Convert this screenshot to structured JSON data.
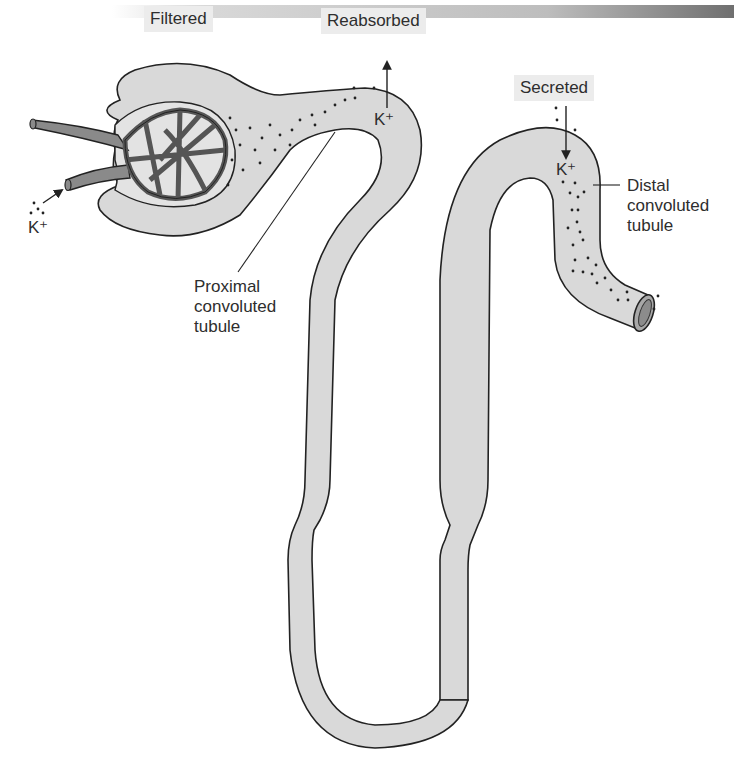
{
  "diagram": {
    "colors": {
      "tubule_fill": "#d9d9d9",
      "outline": "#222222",
      "vessel_fill": "#8a8a8a",
      "label_box": "#ececec",
      "header_bar_start": "#f2f2f2",
      "header_bar_end": "#7a7a7a"
    },
    "process_labels": {
      "filtered": "Filtered",
      "reabsorbed": "Reabsorbed",
      "secreted": "Secreted"
    },
    "ion_labels": {
      "k_afferent": "K⁺",
      "k_reabsorbed": "K⁺",
      "k_secreted": "K⁺"
    },
    "structure_labels": {
      "proximal": "Proximal\nconvoluted\ntubule",
      "distal": "Distal\nconvoluted\ntubule"
    }
  }
}
